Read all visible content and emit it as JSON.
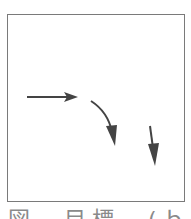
{
  "figure": {
    "frame_color": "#7a7a7a",
    "arrow_color": "#444444",
    "arrows": [
      {
        "name": "straight-right-arrow",
        "path": "M27 97 L68 97",
        "head": "64,92 78,97 64,102 67,97"
      },
      {
        "name": "curved-down-arrow",
        "path": "M91 101 Q108 112 112 132",
        "head": "106,126 117,125 115,146"
      },
      {
        "name": "short-down-arrow",
        "path": "M150 126 L153 148",
        "head": "148,144 159,143 155,166"
      }
    ],
    "caption": "図　目標　(ｂ"
  }
}
